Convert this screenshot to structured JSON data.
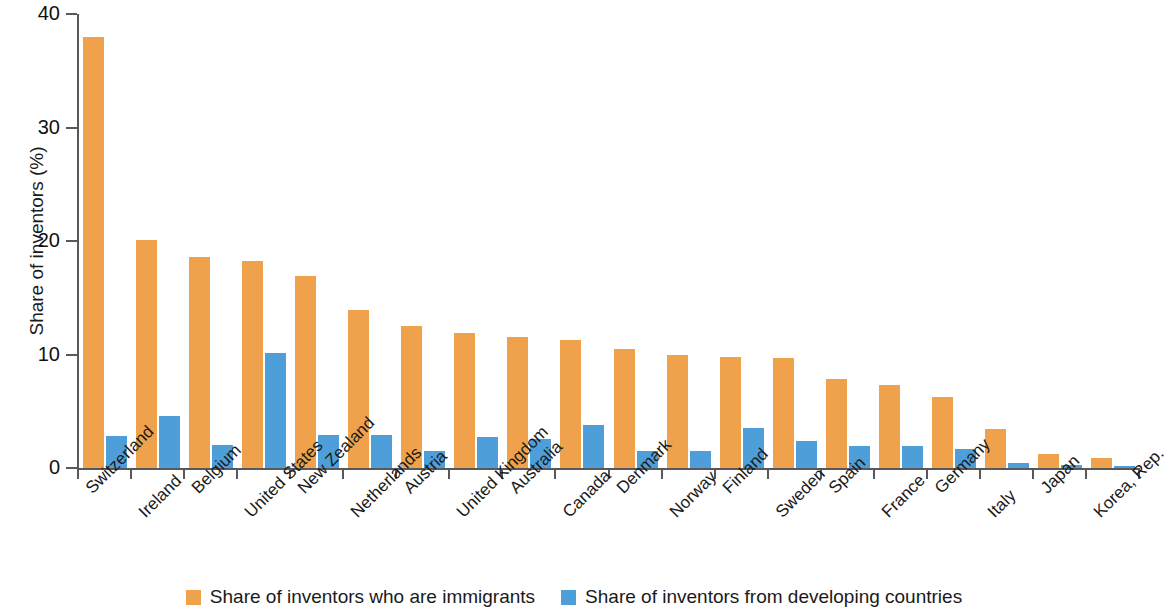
{
  "chart_data": {
    "type": "bar",
    "title": "",
    "xlabel": "",
    "ylabel": "Share of inventors (%)",
    "ylim": [
      0,
      40
    ],
    "yticks": [
      0,
      10,
      20,
      30,
      40
    ],
    "ytick_labels": [
      "0",
      "10",
      "20",
      "30",
      "40"
    ],
    "grid": false,
    "legend_position": "bottom",
    "categories": [
      "Switzerland",
      "Ireland",
      "Belgium",
      "United States",
      "New Zealand",
      "Netherlands",
      "Austria",
      "United Kingdom",
      "Australia",
      "Canada",
      "Denmark",
      "Norway",
      "Finland",
      "Sweden",
      "Spain",
      "France",
      "Germany",
      "Italy",
      "Japan",
      "Korea, Rep."
    ],
    "series": [
      {
        "name": "Share of inventors who are immigrants",
        "color": "#efa24b",
        "values": [
          38.0,
          20.1,
          18.6,
          18.2,
          16.9,
          13.9,
          12.5,
          11.9,
          11.5,
          11.3,
          10.5,
          10.0,
          9.8,
          9.7,
          7.8,
          7.3,
          6.3,
          3.4,
          1.2,
          0.9
        ]
      },
      {
        "name": "Share of inventors from developing countries",
        "color": "#4e9fd9",
        "values": [
          2.8,
          4.6,
          2.0,
          10.1,
          2.9,
          2.9,
          1.5,
          2.7,
          2.6,
          3.8,
          1.5,
          1.5,
          3.5,
          2.4,
          1.9,
          1.9,
          1.7,
          0.4,
          0.3,
          0.2
        ]
      }
    ]
  },
  "legend": {
    "items": [
      {
        "label": "Share of inventors who are immigrants",
        "color": "#efa24b"
      },
      {
        "label": "Share of inventors from developing countries",
        "color": "#4e9fd9"
      }
    ]
  },
  "axes": {
    "y_title": "Share of inventors (%)"
  }
}
